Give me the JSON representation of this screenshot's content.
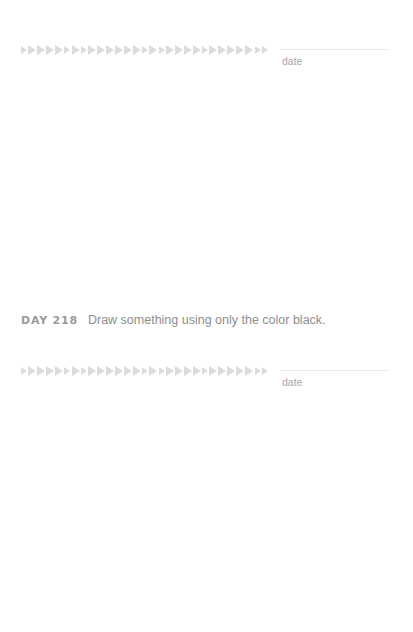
{
  "sections": [
    {
      "date_label": "date",
      "arrow_count": 29
    },
    {
      "date_label": "date",
      "arrow_count": 29
    }
  ],
  "prompt": {
    "day": "DAY 218",
    "text": "Draw something using only the color black."
  },
  "colors": {
    "arrow": "#dcdcdc",
    "date_text": "#a8a8a8",
    "day_text": "#9a9a9a",
    "prompt_text": "#8e8e8e"
  }
}
